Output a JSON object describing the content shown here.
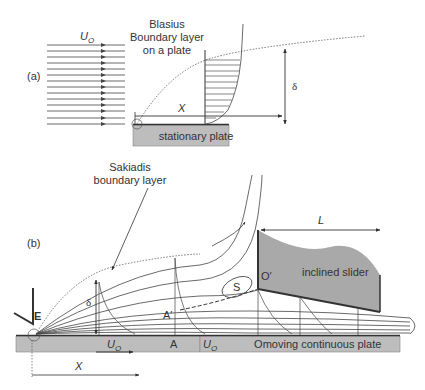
{
  "figure": {
    "panel_a": {
      "label": "(a)",
      "title_line1": "Blasius",
      "title_line2": "Boundary layer",
      "title_line3": "on a plate",
      "freestream_label": "U",
      "freestream_subscript": "O",
      "x_label": "X",
      "delta_label": "δ",
      "plate_label": "stationary plate"
    },
    "panel_b": {
      "label": "(b)",
      "title_line1": "Sakiadis",
      "title_line2": "boundary layer",
      "entry_label": "E",
      "delta_label": "δ",
      "point_A_prime": "A′",
      "point_A": "A",
      "point_O": "O",
      "point_O_prime": "O′",
      "separation_label": "S",
      "slider_label": "inclined slider",
      "length_label": "L",
      "velocity_label_1": "U",
      "velocity_label_1_sub": "O",
      "velocity_label_2": "U",
      "velocity_label_2_sub": "O",
      "plate_label": "moving continuous plate",
      "x_label": "X"
    },
    "colors": {
      "line": "#333333",
      "plate_fill": "#bdbdbd",
      "slider_fill": "#a9a9a9",
      "background": "#ffffff"
    }
  }
}
